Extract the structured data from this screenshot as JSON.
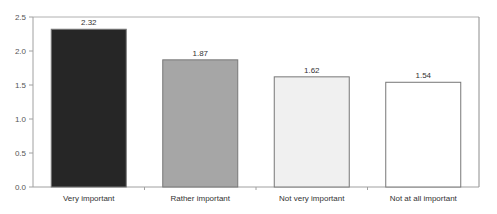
{
  "chart_data": {
    "type": "bar",
    "title": "",
    "xlabel": "",
    "ylabel": "",
    "categories": [
      "Very important",
      "Rather important",
      "Not very important",
      "Not at all important"
    ],
    "values": [
      2.32,
      1.87,
      1.62,
      1.54
    ],
    "data_labels": [
      "2.32",
      "1.87",
      "1.62",
      "1.54"
    ],
    "bar_colors": [
      "#262626",
      "#a6a6a6",
      "#f0f0f0",
      "#ffffff"
    ],
    "ylim": [
      0,
      2.5
    ],
    "yticks": [
      0.0,
      0.5,
      1.0,
      1.5,
      2.0,
      2.5
    ],
    "ytick_labels": [
      "0.0",
      "0.5",
      "1.0",
      "1.5",
      "2.0",
      "2.5"
    ],
    "grid": false,
    "legend": null
  }
}
